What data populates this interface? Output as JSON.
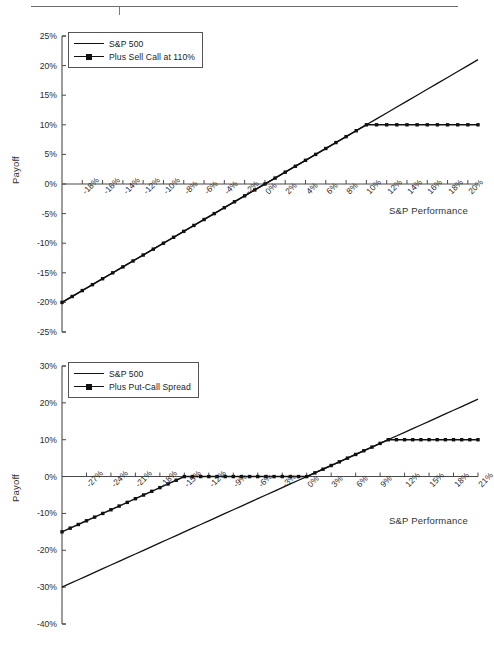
{
  "header": {
    "rule_label": "header-rule"
  },
  "charts": [
    {
      "id": "chart-1",
      "ylabel": "Payoff",
      "xlabel": "S&P Performance",
      "legend": [
        {
          "label": "S&P 500",
          "style": "line"
        },
        {
          "label": "Plus Sell Call at 110%",
          "style": "line-marker"
        }
      ],
      "yticks": [
        "25%",
        "20%",
        "15%",
        "10%",
        "5%",
        "0%",
        "-5%",
        "-10%",
        "-15%",
        "-20%",
        "-25%"
      ],
      "xticks": [
        "-18%",
        "-16%",
        "-14%",
        "-12%",
        "-10%",
        "-8%",
        "-6%",
        "-4%",
        "-2%",
        "0%",
        "2%",
        "4%",
        "6%",
        "8%",
        "10%",
        "12%",
        "14%",
        "16%",
        "18%",
        "20%"
      ]
    },
    {
      "id": "chart-2",
      "ylabel": "Payoff",
      "xlabel": "S&P Performance",
      "legend": [
        {
          "label": "S&P 500",
          "style": "line"
        },
        {
          "label": "Plus Put-Call Spread",
          "style": "line-marker"
        }
      ],
      "yticks": [
        "30%",
        "20%",
        "10%",
        "0%",
        "-10%",
        "-20%",
        "-30%",
        "-40%"
      ],
      "xticks": [
        "-27%",
        "-24%",
        "-21%",
        "-18%",
        "-15%",
        "-12%",
        "-9%",
        "-6%",
        "-3%",
        "0%",
        "3%",
        "6%",
        "9%",
        "12%",
        "15%",
        "18%",
        "21%"
      ]
    }
  ],
  "chart_data": [
    {
      "type": "line",
      "title": "",
      "xlabel": "S&P Performance",
      "ylabel": "Payoff",
      "xlim": [
        -20,
        21
      ],
      "ylim": [
        -25,
        25
      ],
      "xtick_values": [
        -18,
        -16,
        -14,
        -12,
        -10,
        -8,
        -6,
        -4,
        -2,
        0,
        2,
        4,
        6,
        8,
        10,
        12,
        14,
        16,
        18,
        20
      ],
      "ytick_values": [
        25,
        20,
        15,
        10,
        5,
        0,
        -5,
        -10,
        -15,
        -20,
        -25
      ],
      "grid": false,
      "legend_position": "top-left",
      "x": [
        -20,
        -19,
        -18,
        -17,
        -16,
        -15,
        -14,
        -13,
        -12,
        -11,
        -10,
        -9,
        -8,
        -7,
        -6,
        -5,
        -4,
        -3,
        -2,
        -1,
        0,
        1,
        2,
        3,
        4,
        5,
        6,
        7,
        8,
        9,
        10,
        11,
        12,
        13,
        14,
        15,
        16,
        17,
        18,
        19,
        20,
        21
      ],
      "series": [
        {
          "name": "S&P 500",
          "marker": false,
          "values": [
            -20,
            -19,
            -18,
            -17,
            -16,
            -15,
            -14,
            -13,
            -12,
            -11,
            -10,
            -9,
            -8,
            -7,
            -6,
            -5,
            -4,
            -3,
            -2,
            -1,
            0,
            1,
            2,
            3,
            4,
            5,
            6,
            7,
            8,
            9,
            10,
            11,
            12,
            13,
            14,
            15,
            16,
            17,
            18,
            19,
            20,
            21
          ]
        },
        {
          "name": "Plus Sell Call at 110%",
          "marker": true,
          "values": [
            -20,
            -19,
            -18,
            -17,
            -16,
            -15,
            -14,
            -13,
            -12,
            -11,
            -10,
            -9,
            -8,
            -7,
            -6,
            -5,
            -4,
            -3,
            -2,
            -1,
            0,
            1,
            2,
            3,
            4,
            5,
            6,
            7,
            8,
            9,
            10,
            10,
            10,
            10,
            10,
            10,
            10,
            10,
            10,
            10,
            10,
            10
          ]
        }
      ]
    },
    {
      "type": "line",
      "title": "",
      "xlabel": "S&P Performance",
      "ylabel": "Payoff",
      "xlim": [
        -30,
        21
      ],
      "ylim": [
        -40,
        30
      ],
      "xtick_values": [
        -27,
        -24,
        -21,
        -18,
        -15,
        -12,
        -9,
        -6,
        -3,
        0,
        3,
        6,
        9,
        12,
        15,
        18,
        21
      ],
      "ytick_values": [
        30,
        20,
        10,
        0,
        -10,
        -20,
        -30,
        -40
      ],
      "grid": false,
      "legend_position": "top-left",
      "x": [
        -30,
        -29,
        -28,
        -27,
        -26,
        -25,
        -24,
        -23,
        -22,
        -21,
        -20,
        -19,
        -18,
        -17,
        -16,
        -15,
        -14,
        -13,
        -12,
        -11,
        -10,
        -9,
        -8,
        -7,
        -6,
        -5,
        -4,
        -3,
        -2,
        -1,
        0,
        1,
        2,
        3,
        4,
        5,
        6,
        7,
        8,
        9,
        10,
        11,
        12,
        13,
        14,
        15,
        16,
        17,
        18,
        19,
        20,
        21
      ],
      "series": [
        {
          "name": "S&P 500",
          "marker": false,
          "values": [
            -30,
            -29,
            -28,
            -27,
            -26,
            -25,
            -24,
            -23,
            -22,
            -21,
            -20,
            -19,
            -18,
            -17,
            -16,
            -15,
            -14,
            -13,
            -12,
            -11,
            -10,
            -9,
            -8,
            -7,
            -6,
            -5,
            -4,
            -3,
            -2,
            -1,
            0,
            1,
            2,
            3,
            4,
            5,
            6,
            7,
            8,
            9,
            10,
            11,
            12,
            13,
            14,
            15,
            16,
            17,
            18,
            19,
            20,
            21
          ]
        },
        {
          "name": "Plus Put-Call Spread",
          "marker": true,
          "values": [
            -15,
            -14,
            -13,
            -12,
            -11,
            -10,
            -9,
            -8,
            -7,
            -6,
            -5,
            -4,
            -3,
            -2,
            -1,
            0,
            0,
            0,
            0,
            0,
            0,
            0,
            0,
            0,
            0,
            0,
            0,
            0,
            0,
            0,
            0,
            1,
            2,
            3,
            4,
            5,
            6,
            7,
            8,
            9,
            10,
            10,
            10,
            10,
            10,
            10,
            10,
            10,
            10,
            10,
            10,
            10
          ]
        }
      ]
    }
  ]
}
